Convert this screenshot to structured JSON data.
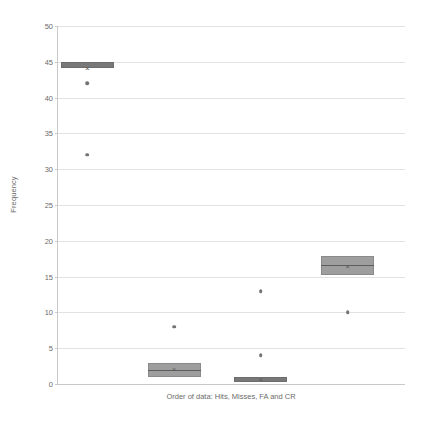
{
  "chart_data": {
    "type": "box",
    "title": "",
    "xlabel": "Order of data: Hits, Misses, FA and CR",
    "ylabel": "Frequency",
    "ylim": [
      0,
      50
    ],
    "ytick_step": 5,
    "yticks": [
      "0",
      "5",
      "10",
      "15",
      "20",
      "25",
      "30",
      "35",
      "40",
      "45",
      "50"
    ],
    "grid": true,
    "legend": "none",
    "categories": [
      "Hits",
      "Misses",
      "FA",
      "CR"
    ],
    "series": [
      {
        "name": "Hits",
        "q1": 44.2,
        "median": 44.6,
        "q3": 45.0,
        "mean": 44.0,
        "whisker_low": 44.2,
        "whisker_high": 45.0,
        "outliers": [
          42,
          32
        ]
      },
      {
        "name": "Misses",
        "q1": 1.0,
        "median": 2.0,
        "q3": 3.0,
        "mean": 2.0,
        "whisker_low": 0.0,
        "whisker_high": 3.0,
        "outliers": [
          8
        ]
      },
      {
        "name": "FA",
        "q1": 0.3,
        "median": 0.6,
        "q3": 1.0,
        "mean": 0.6,
        "whisker_low": 0.0,
        "whisker_high": 1.0,
        "outliers": [
          4,
          13
        ]
      },
      {
        "name": "CR",
        "q1": 15.2,
        "median": 16.6,
        "q3": 17.9,
        "mean": 16.3,
        "whisker_low": 15.2,
        "whisker_high": 17.9,
        "outliers": [
          10
        ]
      }
    ],
    "colors": {
      "box_fill": "#9e9e9e",
      "box_fill_dark": "#787878",
      "box_border": "#8a8a8a",
      "median_line": "#5d5d5d",
      "outlier": "#737373",
      "gridline": "#e2e2e2",
      "axis": "#c9c9c9",
      "text": "#6b6b6b"
    }
  }
}
